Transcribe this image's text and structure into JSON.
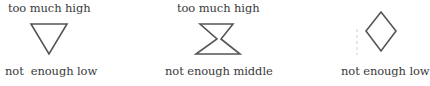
{
  "panels": [
    {
      "top_label": "too much high",
      "shape": "inverted-triangle-icon",
      "bottom_label": "not  enough low"
    },
    {
      "top_label": "too much high",
      "shape": "hourglass-icon",
      "bottom_label": "not enough middle"
    },
    {
      "top_label": "",
      "shape": "diamond-icon",
      "bottom_label": "not enough low"
    }
  ],
  "colors": {
    "stroke": "#555555",
    "text": "#3a3a3a"
  }
}
